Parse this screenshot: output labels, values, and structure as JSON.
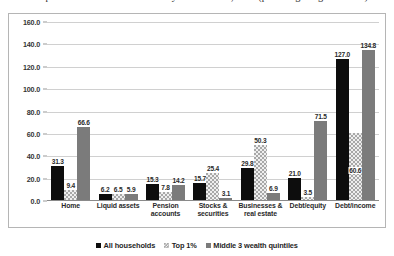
{
  "chart_data": {
    "type": "bar",
    "title": "Composition of Household Wealth by Wealth Class, 2010 (percentage of gross assets)",
    "xlabel": "",
    "ylabel": "",
    "ylim": [
      0,
      160
    ],
    "ytick_step": 20,
    "grid": true,
    "legend_position": "bottom",
    "ytick_labels": [
      "0.0",
      "20.0",
      "40.0",
      "60.0",
      "80.0",
      "100.0",
      "120.0",
      "140.0",
      "160.0"
    ],
    "categories": [
      "Home",
      "Liquid assets",
      "Pension accounts",
      "Stocks & securities",
      "Businesses & real estate",
      "Debt/equity",
      "Debt/income"
    ],
    "category_lines": [
      [
        "Home"
      ],
      [
        "Liquid assets"
      ],
      [
        "Pension",
        "accounts"
      ],
      [
        "Stocks &",
        "securities"
      ],
      [
        "Businesses &",
        "real estate"
      ],
      [
        "Debt/equity"
      ],
      [
        "Debt/income"
      ]
    ],
    "series": [
      {
        "name": "All households",
        "color": "#0d0d0d",
        "values": [
          31.3,
          6.2,
          15.3,
          15.7,
          29.8,
          21.0,
          127.0
        ],
        "labels": [
          "31.3",
          "6.2",
          "15.3",
          "15.7",
          "29.8",
          "21.0",
          "127.0"
        ]
      },
      {
        "name": "Top 1%",
        "color": "#a8a8a8",
        "values": [
          9.4,
          6.5,
          7.8,
          25.4,
          50.3,
          3.5,
          60.6
        ],
        "labels": [
          "9.4",
          "6.5",
          "7.8",
          "25.4",
          "50.3",
          "3.5",
          "60.6"
        ]
      },
      {
        "name": "Middle 3 wealth quintiles",
        "color": "#7b7b7b",
        "values": [
          66.6,
          5.9,
          14.2,
          3.1,
          6.9,
          71.5,
          134.8
        ],
        "labels": [
          "66.6",
          "5.9",
          "14.2",
          "3.1",
          "6.9",
          "71.5",
          "134.8"
        ]
      }
    ]
  }
}
